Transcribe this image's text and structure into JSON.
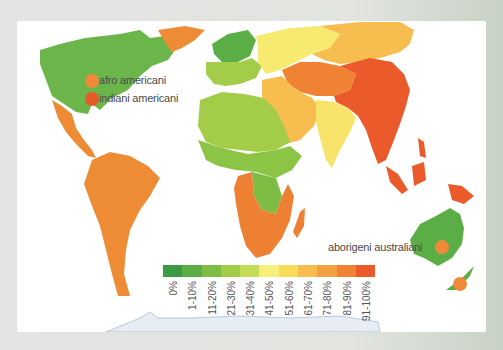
{
  "map": {
    "type": "choropleth world map",
    "subject": "percentage by region",
    "background_color": "#e3e4e1",
    "panel_color": "#ffffff"
  },
  "legend": {
    "items": [
      {
        "label": "0%",
        "color": "#3a9a45"
      },
      {
        "label": "1-10%",
        "color": "#5aae45"
      },
      {
        "label": "11-20%",
        "color": "#7ebd44"
      },
      {
        "label": "21-30%",
        "color": "#a3cc48"
      },
      {
        "label": "31-40%",
        "color": "#c5dc55"
      },
      {
        "label": "41-50%",
        "color": "#f6ef7a"
      },
      {
        "label": "51-60%",
        "color": "#f9dd5a"
      },
      {
        "label": "61-70%",
        "color": "#f7bd4e"
      },
      {
        "label": "71-80%",
        "color": "#f3a042"
      },
      {
        "label": "81-90%",
        "color": "#ef8233"
      },
      {
        "label": "91-100%",
        "color": "#ea5a2a"
      }
    ]
  },
  "annotations": [
    {
      "label": "afro americani",
      "marker_color": "#ee8a3a"
    },
    {
      "label": "indiani americani",
      "marker_color": "#e65a2a"
    },
    {
      "label": "aborigeni australiani",
      "marker_color": "#ee8a3a"
    }
  ],
  "regions": {
    "north_america": "#6cb54a",
    "greenland": "#ee8b35",
    "central_america": "#ee8b35",
    "south_america": "#ee8b35",
    "northern_europe": "#5aae45",
    "europe": "#a3cc48",
    "eastern_europe_russia": "#f6ea70",
    "siberia": "#f7bd4e",
    "central_asia": "#ef8233",
    "china_southeast_asia": "#ea5a2a",
    "middle_east": "#f7bd4e",
    "india": "#f8e46a",
    "north_africa": "#a3cc48",
    "west_africa": "#8cc445",
    "central_africa": "#7ebd44",
    "southern_africa": "#ee8034",
    "australia": "#5aae45",
    "new_zealand": "#5aae45",
    "indonesia_papua": "#ea5a2a",
    "antarctica": "#e8edf3"
  }
}
